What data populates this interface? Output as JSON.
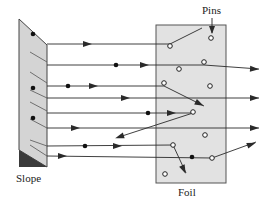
{
  "labels": {
    "slope": "Slope",
    "foil": "Foil",
    "pins": "Pins"
  },
  "colors": {
    "background": "#ffffff",
    "slope_fill": "#d4d4d4",
    "slope_dark": "#3a3a3a",
    "foil_fill": "#e2e2e2",
    "line": "#2a2a2a"
  },
  "slope": {
    "polygon": [
      [
        19,
        19
      ],
      [
        47,
        45
      ],
      [
        47,
        167
      ],
      [
        19,
        150
      ]
    ],
    "dark_triangle": [
      [
        19,
        150
      ],
      [
        47,
        167
      ],
      [
        19,
        167
      ]
    ],
    "hatches": [
      [
        30,
        52,
        47,
        62
      ],
      [
        30,
        72,
        47,
        83
      ],
      [
        30,
        90,
        47,
        98
      ],
      [
        30,
        102,
        47,
        111
      ],
      [
        30,
        119,
        47,
        128
      ],
      [
        30,
        140,
        47,
        146
      ],
      [
        30,
        145,
        47,
        156
      ]
    ],
    "dots": [
      [
        33,
        34
      ],
      [
        33,
        88
      ],
      [
        33,
        118
      ]
    ]
  },
  "foil": {
    "x": 156,
    "y": 25,
    "width": 70,
    "height": 158
  },
  "pins": [
    [
      170,
      46
    ],
    [
      211,
      38
    ],
    [
      204,
      62
    ],
    [
      179,
      69
    ],
    [
      164,
      83
    ],
    [
      210,
      86
    ],
    [
      193,
      112
    ],
    [
      205,
      135
    ],
    [
      173,
      145
    ],
    [
      212,
      158
    ],
    [
      165,
      174
    ]
  ],
  "pins_pointer": {
    "x1": 212,
    "y1": 18,
    "x2": 212,
    "y2": 33
  },
  "paths": [
    {
      "points": [
        [
          47,
          44
        ],
        [
          170,
          44
        ],
        [
          202,
          28
        ]
      ],
      "arrows": [
        [
          88,
          44
        ]
      ]
    },
    {
      "points": [
        [
          47,
          65
        ],
        [
          204,
          65
        ],
        [
          259,
          69
        ]
      ],
      "dots": [
        [
          116,
          65
        ]
      ],
      "arrows": [
        [
          145,
          65
        ],
        [
          255,
          69
        ]
      ]
    },
    {
      "points": [
        [
          47,
          86
        ],
        [
          164,
          86
        ],
        [
          204,
          106
        ]
      ],
      "dots": [
        [
          68,
          86
        ]
      ],
      "arrows": [
        [
          94,
          86
        ],
        [
          200,
          104
        ]
      ]
    },
    {
      "points": [
        [
          47,
          98
        ],
        [
          259,
          98
        ]
      ],
      "arrows": [
        [
          126,
          98
        ],
        [
          255,
          98
        ]
      ]
    },
    {
      "points": [
        [
          47,
          113
        ],
        [
          193,
          113
        ]
      ],
      "dots": [
        [
          148,
          113
        ]
      ],
      "arrows": [
        [
          172,
          113
        ]
      ]
    },
    {
      "points": [
        [
          193,
          113
        ],
        [
          119,
          137
        ]
      ],
      "arrows": [
        [
          119,
          137
        ]
      ]
    },
    {
      "points": [
        [
          47,
          128
        ],
        [
          259,
          128
        ]
      ],
      "arrows": [
        [
          76,
          128
        ],
        [
          255,
          128
        ]
      ]
    },
    {
      "points": [
        [
          47,
          146
        ],
        [
          173,
          145
        ],
        [
          186,
          173
        ]
      ],
      "dots": [
        [
          85,
          146
        ]
      ],
      "arrows": [
        [
          118,
          146
        ],
        [
          184,
          170
        ]
      ]
    },
    {
      "points": [
        [
          47,
          156
        ],
        [
          212,
          158
        ],
        [
          256,
          142
        ]
      ],
      "dots": [
        [
          192,
          157
        ]
      ],
      "arrows": [
        [
          63,
          156
        ],
        [
          252,
          144
        ]
      ]
    }
  ]
}
